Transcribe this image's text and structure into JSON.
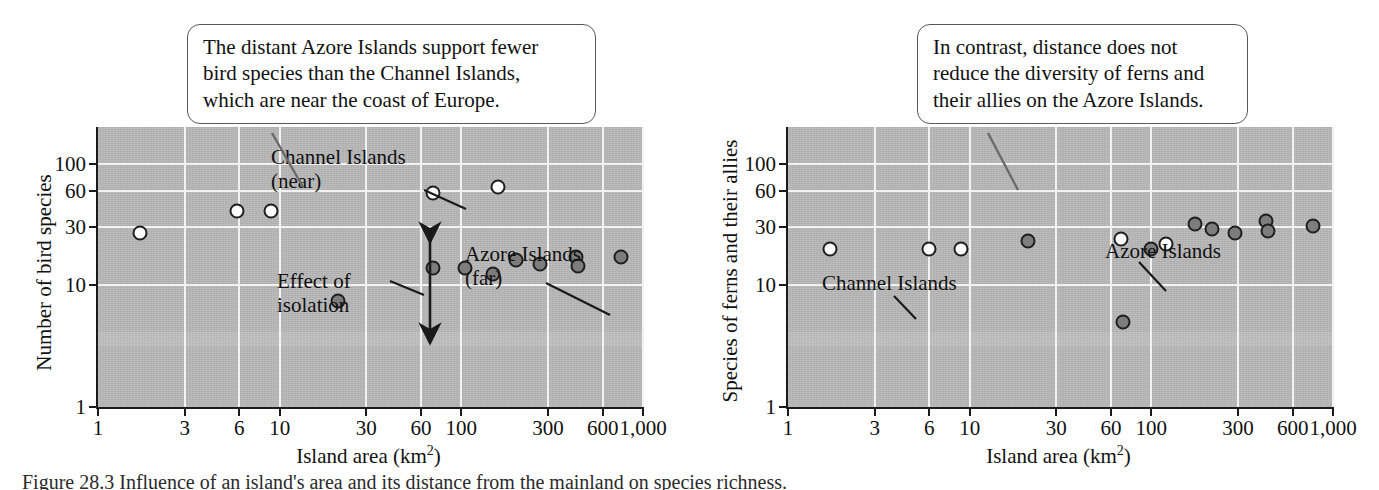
{
  "figure": {
    "caption": "Figure 28.3  Influence of an island's area and its distance from the mainland on species richness."
  },
  "callouts": [
    {
      "id": "callout-birds",
      "lines": [
        "The distant Azore Islands support fewer",
        "bird species than the Channel Islands,",
        "which are near the coast of Europe."
      ]
    },
    {
      "id": "callout-ferns",
      "lines": [
        "In contrast, distance does not",
        "reduce the diversity of ferns and",
        "their allies on the Azore Islands."
      ]
    }
  ],
  "chart_data": [
    {
      "type": "scatter",
      "title": "",
      "xlabel": "Island area (km2)",
      "xlabel_base": "Island area (km",
      "xlabel_sup": "2",
      "xlabel_tail": ")",
      "ylabel": "Number of bird species",
      "xscale": "log",
      "yscale": "log",
      "xlim": [
        1,
        1000
      ],
      "ylim": [
        1,
        200
      ],
      "xticks": [
        1,
        3,
        6,
        10,
        30,
        60,
        100,
        300,
        600,
        1000
      ],
      "xticklabels": [
        "1",
        "3",
        "6",
        "10",
        "30",
        "60",
        "100",
        "300",
        "600",
        "1,000"
      ],
      "yticks": [
        1,
        10,
        30,
        60,
        100
      ],
      "yticklabels": [
        "1",
        "10",
        "30",
        "60",
        "100"
      ],
      "grid": true,
      "legend": "none",
      "annotations": [
        {
          "name": "channel-islands-near",
          "text_lines": [
            "Channel Islands",
            "(near)"
          ]
        },
        {
          "name": "azore-islands-far",
          "text_lines": [
            "Azore Islands",
            "(far)"
          ]
        },
        {
          "name": "effect-of-isolation",
          "text_lines": [
            "Effect of",
            "isolation"
          ]
        }
      ],
      "series": [
        {
          "name": "Channel Islands (near)",
          "marker": "open-circle",
          "color": "#fdfdfd",
          "points": [
            {
              "x": 1.7,
              "y": 27
            },
            {
              "x": 5.8,
              "y": 41
            },
            {
              "x": 9.0,
              "y": 41
            },
            {
              "x": 70,
              "y": 57
            },
            {
              "x": 160,
              "y": 64
            }
          ]
        },
        {
          "name": "Azore Islands (far)",
          "marker": "filled-circle",
          "color": "#7d7d7d",
          "points": [
            {
              "x": 21,
              "y": 7.5
            },
            {
              "x": 70,
              "y": 14
            },
            {
              "x": 105,
              "y": 14
            },
            {
              "x": 150,
              "y": 12.5
            },
            {
              "x": 200,
              "y": 16
            },
            {
              "x": 270,
              "y": 15
            },
            {
              "x": 430,
              "y": 17
            },
            {
              "x": 440,
              "y": 14.5
            },
            {
              "x": 760,
              "y": 17
            }
          ]
        }
      ]
    },
    {
      "type": "scatter",
      "title": "",
      "xlabel": "Island area (km2)",
      "xlabel_base": "Island area (km",
      "xlabel_sup": "2",
      "xlabel_tail": ")",
      "ylabel": "Species of ferns and their allies",
      "xscale": "log",
      "yscale": "log",
      "xlim": [
        1,
        1000
      ],
      "ylim": [
        1,
        200
      ],
      "xticks": [
        1,
        3,
        6,
        10,
        30,
        60,
        100,
        300,
        600,
        1000
      ],
      "xticklabels": [
        "1",
        "3",
        "6",
        "10",
        "30",
        "60",
        "100",
        "300",
        "600",
        "1,000"
      ],
      "yticks": [
        1,
        10,
        30,
        60,
        100
      ],
      "yticklabels": [
        "1",
        "10",
        "30",
        "60",
        "100"
      ],
      "grid": true,
      "legend": "none",
      "annotations": [
        {
          "name": "channel-islands",
          "text_lines": [
            "Channel Islands"
          ]
        },
        {
          "name": "azore-islands",
          "text_lines": [
            "Azore Islands"
          ]
        }
      ],
      "series": [
        {
          "name": "Channel Islands",
          "marker": "open-circle",
          "color": "#fdfdfd",
          "points": [
            {
              "x": 1.7,
              "y": 20
            },
            {
              "x": 6.0,
              "y": 20
            },
            {
              "x": 9.0,
              "y": 20
            },
            {
              "x": 68,
              "y": 24
            },
            {
              "x": 120,
              "y": 22
            }
          ]
        },
        {
          "name": "Azore Islands",
          "marker": "filled-circle",
          "color": "#7d7d7d",
          "points": [
            {
              "x": 21,
              "y": 23
            },
            {
              "x": 70,
              "y": 5
            },
            {
              "x": 100,
              "y": 20
            },
            {
              "x": 175,
              "y": 32
            },
            {
              "x": 215,
              "y": 29
            },
            {
              "x": 290,
              "y": 27
            },
            {
              "x": 430,
              "y": 34
            },
            {
              "x": 440,
              "y": 28
            },
            {
              "x": 780,
              "y": 31
            }
          ]
        }
      ]
    }
  ]
}
